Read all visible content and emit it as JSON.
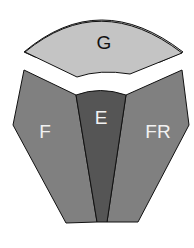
{
  "diagram": {
    "regions": [
      {
        "id": "G",
        "label": "G",
        "fill": "#c4c4c4",
        "label_color": "#111111"
      },
      {
        "id": "F",
        "label": "F",
        "fill": "#7f7f7f",
        "label_color": "#f2f2f2"
      },
      {
        "id": "E",
        "label": "E",
        "fill": "#555555",
        "label_color": "#f2f2f2"
      },
      {
        "id": "FR",
        "label": "FR",
        "fill": "#7f7f7f",
        "label_color": "#f2f2f2"
      }
    ],
    "stroke": "#111111"
  }
}
